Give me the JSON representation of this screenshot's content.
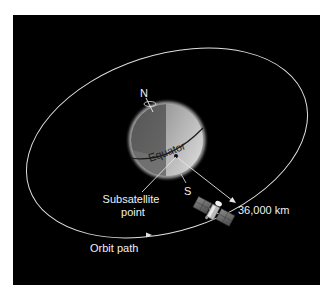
{
  "diagram": {
    "type": "geostationary-orbit-illustration",
    "background_color": "#000000",
    "page_color": "#ffffff",
    "labels": {
      "north": "N",
      "south": "S",
      "equator": "Equator",
      "subsatellite_line1": "Subsatellite",
      "subsatellite_line2": "point",
      "distance": "36,000 km",
      "orbit": "Orbit path"
    },
    "colors": {
      "line": "#e6e6e6",
      "text": "#f0f0f0",
      "globe_dark": "#5c5c5c",
      "globe_light": "#c8c8c8",
      "globe_halo": "#9a9a9a"
    }
  }
}
